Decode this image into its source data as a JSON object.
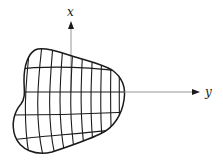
{
  "figure": {
    "type": "coordinate-diagram",
    "axes": {
      "vertical": {
        "label": "x",
        "direction": "up"
      },
      "horizontal": {
        "label": "y",
        "direction": "right"
      }
    },
    "colors": {
      "outline": "#1a1a1a",
      "grid": "#1a1a1a",
      "axis": "#8a8a8a",
      "background": "#ffffff"
    },
    "region": {
      "shape": "irregular-blob",
      "grid": {
        "vertical_lines": 10,
        "horizontal_lines": 4
      }
    }
  }
}
